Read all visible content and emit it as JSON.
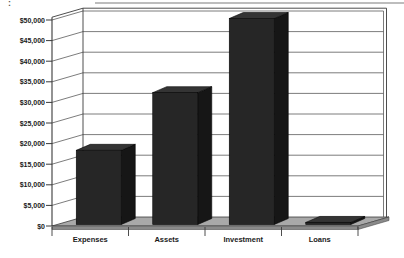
{
  "artifacts": {
    "colon": ":"
  },
  "chart_data": {
    "type": "bar",
    "subtype": "3d-column",
    "title": "",
    "xlabel": "",
    "ylabel": "",
    "categories": [
      "Expenses",
      "Assets",
      "Investment",
      "Loans"
    ],
    "values": [
      18000,
      32000,
      50000,
      500
    ],
    "ylim": [
      0,
      50000
    ],
    "ytick_step": 5000,
    "ytick_labels": [
      "$0",
      "$5,000",
      "$10,000",
      "$15,000",
      "$20,000",
      "$25,000",
      "$30,000",
      "$35,000",
      "$40,000",
      "$45,000",
      "$50,000"
    ],
    "grid": true,
    "legend": false,
    "colors": {
      "background": "#ffffff",
      "bar_front": "#262626",
      "bar_side": "#161616",
      "bar_top": "#343434",
      "bar_stroke": "#050505",
      "floor": "#a9a9a9",
      "floor_side": "#8a8a8a",
      "gridline": "#5a5a5a",
      "axis": "#3a3a3a",
      "label": "#1a1a1a"
    }
  }
}
